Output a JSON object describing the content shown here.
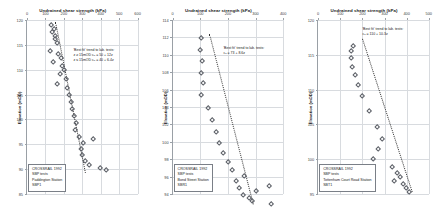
{
  "figure": {
    "caption_common": "Undrained shear strength (kPa)",
    "y_axis_title": "Elevation (mOD)"
  },
  "chart_data": [
    {
      "type": "scatter",
      "title": "Undrained shear strength (kPa)",
      "xlabel": "Undrained shear strength (kPa)",
      "ylabel": "Elevation (mOD)",
      "xlim": [
        0,
        600
      ],
      "ylim": [
        85,
        120
      ],
      "xticks": [
        0,
        100,
        200,
        300,
        400,
        500,
        600
      ],
      "xticklabels": [
        "0",
        "100",
        "200",
        "300",
        "400",
        "500",
        "600"
      ],
      "yticks": [
        85,
        90,
        95,
        100,
        105,
        110,
        115,
        120
      ],
      "yticklabels": [
        "85",
        "90",
        "95",
        "100",
        "105",
        "110",
        "115",
        "120"
      ],
      "grid": true,
      "legend_position": "bottom-left",
      "legend_lines": [
        "CROSSRAIL 1992",
        "SBP tests",
        "Paddington Station",
        "SBP1"
      ],
      "annotation": {
        "line1": "'Best fit' trend to lab. tests:",
        "line2": "z ≥ 15mOD     cᵤ = 50 + 12z",
        "line3": "z ≤ 15mOD     cᵤ = 40 + 6.4z"
      },
      "points": [
        {
          "x": 128,
          "y": 119.1
        },
        {
          "x": 140,
          "y": 118.4
        },
        {
          "x": 133,
          "y": 117.7
        },
        {
          "x": 150,
          "y": 117.0
        },
        {
          "x": 146,
          "y": 116.3
        },
        {
          "x": 158,
          "y": 115.6
        },
        {
          "x": 120,
          "y": 114.0
        },
        {
          "x": 165,
          "y": 113.4
        },
        {
          "x": 178,
          "y": 112.6
        },
        {
          "x": 138,
          "y": 111.8
        },
        {
          "x": 186,
          "y": 111.0
        },
        {
          "x": 196,
          "y": 110.2
        },
        {
          "x": 175,
          "y": 109.3
        },
        {
          "x": 205,
          "y": 108.2
        },
        {
          "x": 160,
          "y": 107.3
        },
        {
          "x": 215,
          "y": 106.4
        },
        {
          "x": 222,
          "y": 105.0
        },
        {
          "x": 232,
          "y": 103.6
        },
        {
          "x": 240,
          "y": 102.2
        },
        {
          "x": 248,
          "y": 100.8
        },
        {
          "x": 262,
          "y": 99.4
        },
        {
          "x": 255,
          "y": 98.0
        },
        {
          "x": 278,
          "y": 96.6
        },
        {
          "x": 300,
          "y": 95.4
        },
        {
          "x": 286,
          "y": 94.2
        },
        {
          "x": 352,
          "y": 96.2
        },
        {
          "x": 295,
          "y": 93.0
        },
        {
          "x": 310,
          "y": 91.9
        },
        {
          "x": 330,
          "y": 91.0
        },
        {
          "x": 392,
          "y": 90.3
        },
        {
          "x": 425,
          "y": 90.0
        }
      ],
      "trend": {
        "x_top": 150,
        "y_top": 119.6,
        "x_bottom": 312,
        "y_bottom": 89.2
      }
    },
    {
      "type": "scatter",
      "title": "Undrained shear strength (kPa)",
      "xlabel": "Undrained shear strength (kPa)",
      "ylabel": "Elevation (mOD)",
      "xlim": [
        0,
        400
      ],
      "ylim": [
        94,
        114
      ],
      "xticks": [
        0,
        100,
        200,
        300,
        400
      ],
      "xticklabels": [
        "0",
        "100",
        "200",
        "300",
        "400"
      ],
      "yticks": [
        94,
        96,
        98,
        100,
        102,
        104,
        106,
        108,
        110,
        112,
        114
      ],
      "yticklabels": [
        "94",
        "96",
        "98",
        "100",
        "102",
        "104",
        "106",
        "108",
        "110",
        "112",
        "114"
      ],
      "grid": true,
      "legend_position": "bottom-left",
      "legend_lines": [
        "CROSSRAIL 1992",
        "SBP tests",
        "Bond Street Station",
        "SBR1"
      ],
      "annotation": {
        "line1": "'Best fit' trend to lab. tests:",
        "line2": "cᵤ = 73 + 8.6z",
        "line3": ""
      },
      "points": [
        {
          "x": 101,
          "y": 112.0
        },
        {
          "x": 96,
          "y": 110.6
        },
        {
          "x": 103,
          "y": 109.4
        },
        {
          "x": 99,
          "y": 108.0
        },
        {
          "x": 106,
          "y": 106.8
        },
        {
          "x": 101,
          "y": 105.5
        },
        {
          "x": 126,
          "y": 104.0
        },
        {
          "x": 140,
          "y": 102.6
        },
        {
          "x": 153,
          "y": 101.2
        },
        {
          "x": 165,
          "y": 100.0
        },
        {
          "x": 181,
          "y": 98.8
        },
        {
          "x": 196,
          "y": 97.8
        },
        {
          "x": 213,
          "y": 96.8
        },
        {
          "x": 255,
          "y": 96.2
        },
        {
          "x": 226,
          "y": 95.6
        },
        {
          "x": 238,
          "y": 94.8
        },
        {
          "x": 345,
          "y": 95.0
        },
        {
          "x": 300,
          "y": 94.4
        },
        {
          "x": 250,
          "y": 94.0
        },
        {
          "x": 272,
          "y": 93.6
        },
        {
          "x": 285,
          "y": 93.3
        },
        {
          "x": 352,
          "y": 93.0
        }
      ],
      "trend": {
        "x_top": 130,
        "y_top": 112.4,
        "x_bottom": 288,
        "y_bottom": 92.8
      }
    },
    {
      "type": "scatter",
      "title": "Undrained shear strength (kPa)",
      "xlabel": "Undrained shear strength (kPa)",
      "ylabel": "Elevation (mOD)",
      "xlim": [
        0,
        500
      ],
      "ylim": [
        95,
        120
      ],
      "xticks": [
        0,
        100,
        200,
        300,
        400,
        500
      ],
      "xticklabels": [
        "0",
        "100",
        "200",
        "300",
        "400",
        "500"
      ],
      "yticks": [
        95,
        100,
        105,
        110,
        115,
        120
      ],
      "yticklabels": [
        "95",
        "100",
        "105",
        "110",
        "115",
        "120"
      ],
      "grid": true,
      "legend_position": "bottom-left",
      "legend_lines": [
        "CROSSRAIL 1992",
        "SBP tests",
        "Tottenham Court Road Station",
        "SBT1"
      ],
      "annotation": {
        "line1": "'Best fit' trend to lab. tests:",
        "line2": "cᵤ = 110 + 10.3z",
        "line3": ""
      },
      "points": [
        {
          "x": 152,
          "y": 116.4
        },
        {
          "x": 146,
          "y": 115.6
        },
        {
          "x": 143,
          "y": 114.6
        },
        {
          "x": 150,
          "y": 113.4
        },
        {
          "x": 163,
          "y": 112.2
        },
        {
          "x": 178,
          "y": 110.8
        },
        {
          "x": 195,
          "y": 109.2
        },
        {
          "x": 225,
          "y": 107.0
        },
        {
          "x": 260,
          "y": 104.8
        },
        {
          "x": 285,
          "y": 103.0
        },
        {
          "x": 268,
          "y": 101.6
        },
        {
          "x": 243,
          "y": 100.1
        },
        {
          "x": 330,
          "y": 99.0
        },
        {
          "x": 352,
          "y": 98.2
        },
        {
          "x": 365,
          "y": 97.6
        },
        {
          "x": 340,
          "y": 97.0
        },
        {
          "x": 378,
          "y": 96.6
        },
        {
          "x": 392,
          "y": 96.0
        },
        {
          "x": 408,
          "y": 95.4
        }
      ],
      "trend": {
        "x_top": 196,
        "y_top": 117.2,
        "x_bottom": 420,
        "y_bottom": 95.2
      }
    }
  ]
}
